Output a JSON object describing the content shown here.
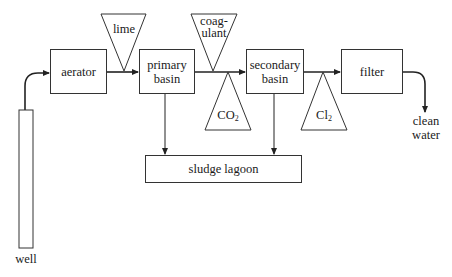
{
  "diagram": {
    "nodes": {
      "well": {
        "label": "well"
      },
      "aerator": {
        "label": "aerator"
      },
      "primary_basin": {
        "line1": "primary",
        "line2": "basin"
      },
      "secondary_basin": {
        "line1": "secondary",
        "line2": "basin"
      },
      "filter": {
        "label": "filter"
      },
      "sludge_lagoon": {
        "label": "sludge lagoon"
      },
      "clean_water": {
        "line1": "clean",
        "line2": "water"
      }
    },
    "additives": {
      "lime": {
        "label": "lime"
      },
      "coagulant": {
        "line1": "coag-",
        "line2": "ulant"
      },
      "co2": {
        "main": "CO",
        "sub": "2"
      },
      "cl2": {
        "main": "Cl",
        "sub": "2"
      }
    },
    "edges": [
      {
        "from": "well",
        "to": "aerator"
      },
      {
        "from": "aerator",
        "to": "primary basin",
        "additive": "lime"
      },
      {
        "from": "primary basin",
        "to": "secondary basin",
        "additive": [
          "coagulant",
          "CO2"
        ]
      },
      {
        "from": "secondary basin",
        "to": "filter",
        "additive": "Cl2"
      },
      {
        "from": "filter",
        "to": "clean water"
      },
      {
        "from": "primary basin",
        "to": "sludge lagoon"
      },
      {
        "from": "secondary basin",
        "to": "sludge lagoon"
      }
    ]
  }
}
